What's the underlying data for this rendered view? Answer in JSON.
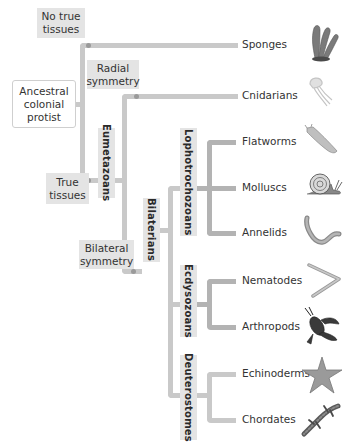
{
  "diagram": {
    "type": "phylogenetic-tree",
    "root": "Ancestral colonial protist",
    "character_labels": {
      "no_true_tissues": "No true\ntissues",
      "radial_symmetry": "Radial\nsymmetry",
      "true_tissues": "True\ntissues",
      "bilateral_symmetry": "Bilateral\nsymmetry"
    },
    "root_label": "Ancestral\ncolonial\nprotist",
    "clades": {
      "eumetazoans": "Eumetazoans",
      "bilaterians": "Bilaterians",
      "lophotrochozoans": "Lophotrochozoans",
      "ecdysozoans": "Ecdysozoans",
      "deuterostomes": "Deuterostomes"
    },
    "taxa": [
      {
        "name": "Sponges",
        "icon": "sponge-icon"
      },
      {
        "name": "Cnidarians",
        "icon": "jellyfish-icon"
      },
      {
        "name": "Flatworms",
        "icon": "flatworm-icon"
      },
      {
        "name": "Molluscs",
        "icon": "snail-icon"
      },
      {
        "name": "Annelids",
        "icon": "earthworm-icon"
      },
      {
        "name": "Nematodes",
        "icon": "nematode-icon"
      },
      {
        "name": "Arthropods",
        "icon": "lobster-icon"
      },
      {
        "name": "Echinoderms",
        "icon": "starfish-icon"
      },
      {
        "name": "Chordates",
        "icon": "salamander-icon"
      }
    ],
    "colors": {
      "branch": "#c9c9c9",
      "node": "#9a9a9a",
      "label_bg": "#e4e4e4"
    }
  }
}
